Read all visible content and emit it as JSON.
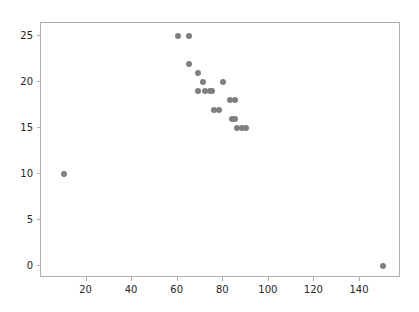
{
  "chart_data": {
    "type": "scatter",
    "title": "",
    "xlabel": "",
    "ylabel": "",
    "xlim": [
      0,
      158
    ],
    "ylim": [
      -1.3,
      26.4
    ],
    "grid": false,
    "legend": null,
    "marker": {
      "shape": "circle",
      "color": "#7f7f7f",
      "size_px": 6
    },
    "xticks": [
      20,
      40,
      60,
      80,
      100,
      120,
      140
    ],
    "yticks": [
      0,
      5,
      10,
      15,
      20,
      25
    ],
    "xtick_labels": [
      "20",
      "40",
      "60",
      "80",
      "100",
      "120",
      "140"
    ],
    "ytick_labels": [
      "0",
      "5",
      "10",
      "15",
      "20",
      "25"
    ],
    "points": [
      {
        "x": 10,
        "y": 10
      },
      {
        "x": 60,
        "y": 25
      },
      {
        "x": 65,
        "y": 25
      },
      {
        "x": 65,
        "y": 22
      },
      {
        "x": 69,
        "y": 21
      },
      {
        "x": 69,
        "y": 19
      },
      {
        "x": 71,
        "y": 20
      },
      {
        "x": 72,
        "y": 19
      },
      {
        "x": 74,
        "y": 19
      },
      {
        "x": 75,
        "y": 19
      },
      {
        "x": 76,
        "y": 17
      },
      {
        "x": 78,
        "y": 17
      },
      {
        "x": 80,
        "y": 20
      },
      {
        "x": 83,
        "y": 18
      },
      {
        "x": 84,
        "y": 16
      },
      {
        "x": 85,
        "y": 18
      },
      {
        "x": 85,
        "y": 16
      },
      {
        "x": 86,
        "y": 15
      },
      {
        "x": 88,
        "y": 15
      },
      {
        "x": 90,
        "y": 15
      },
      {
        "x": 150,
        "y": 0
      }
    ]
  },
  "figure": {
    "background_color": "#ffffff",
    "axes_color": "#b0b0b0",
    "tick_label_color": "#262626"
  }
}
